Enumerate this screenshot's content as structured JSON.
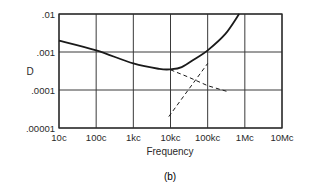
{
  "chart_data": {
    "type": "line",
    "title": "",
    "caption": "(b)",
    "xlabel": "Frequency",
    "ylabel": "D",
    "xscale": "log",
    "yscale": "log",
    "x_tick_labels": [
      "10c",
      "100c",
      "1kc",
      "10kc",
      "100kc",
      "1Mc",
      "10Mc"
    ],
    "x_tick_values": [
      10,
      100,
      1000,
      10000,
      100000,
      1000000,
      10000000
    ],
    "y_tick_labels": [
      ".01",
      ".001",
      ".0001",
      ".00001"
    ],
    "y_tick_values": [
      0.01,
      0.001,
      0.0001,
      1e-05
    ],
    "xlim": [
      10,
      10000000
    ],
    "ylim": [
      1e-05,
      0.01
    ],
    "grid": true,
    "legend": null,
    "series": [
      {
        "name": "D (total)",
        "style": "solid",
        "x": [
          10,
          100,
          1000,
          5000,
          10000,
          20000,
          50000,
          100000,
          300000,
          700000
        ],
        "y": [
          0.002,
          0.0011,
          0.0005,
          0.00036,
          0.00035,
          0.0004,
          0.0007,
          0.0011,
          0.003,
          0.01
        ]
      },
      {
        "name": "low-frequency asymptote",
        "style": "dashed",
        "x": [
          10000,
          30000,
          100000,
          350000
        ],
        "y": [
          0.00034,
          0.00022,
          0.00013,
          9e-05
        ]
      },
      {
        "name": "high-frequency asymptote",
        "style": "dashed",
        "x": [
          9000,
          30000,
          100000
        ],
        "y": [
          2e-05,
          0.0001,
          0.0005
        ]
      }
    ]
  },
  "labels": {
    "ylabel": "D",
    "xlabel": "Frequency",
    "caption": "(b)",
    "y_ticks": [
      ".01",
      ".001",
      ".0001",
      ".00001"
    ],
    "x_ticks": [
      "10c",
      "100c",
      "1kc",
      "10kc",
      "100kc",
      "1Mc",
      "10Mc"
    ]
  },
  "colors": {
    "line": "#1a1a1a",
    "grid": "#3a3a3a",
    "background": "#ffffff"
  }
}
